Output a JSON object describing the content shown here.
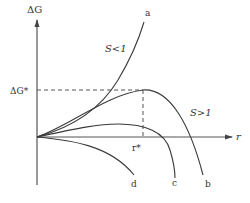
{
  "diagram": {
    "title": "",
    "y_axis_label": "ΔG",
    "x_axis_label": "r",
    "critical_energy_label": "ΔG*",
    "critical_radius_label": "r*",
    "region_labels": {
      "undersaturated": "S<1",
      "supersaturated": "S>1"
    },
    "curves": [
      {
        "id": "a",
        "label": "a",
        "description": "monotonically increasing free energy (S<1)"
      },
      {
        "id": "b",
        "label": "b",
        "description": "maximum at ΔG* at r*, then decreasing (S>1)"
      },
      {
        "id": "c",
        "label": "c",
        "description": "smaller maximum, then decreasing (S>1)"
      },
      {
        "id": "d",
        "label": "d",
        "description": "monotonically decreasing free energy"
      }
    ],
    "colors": {
      "line": "#3a3a3a",
      "axis": "#555555",
      "background": "#ffffff"
    }
  }
}
